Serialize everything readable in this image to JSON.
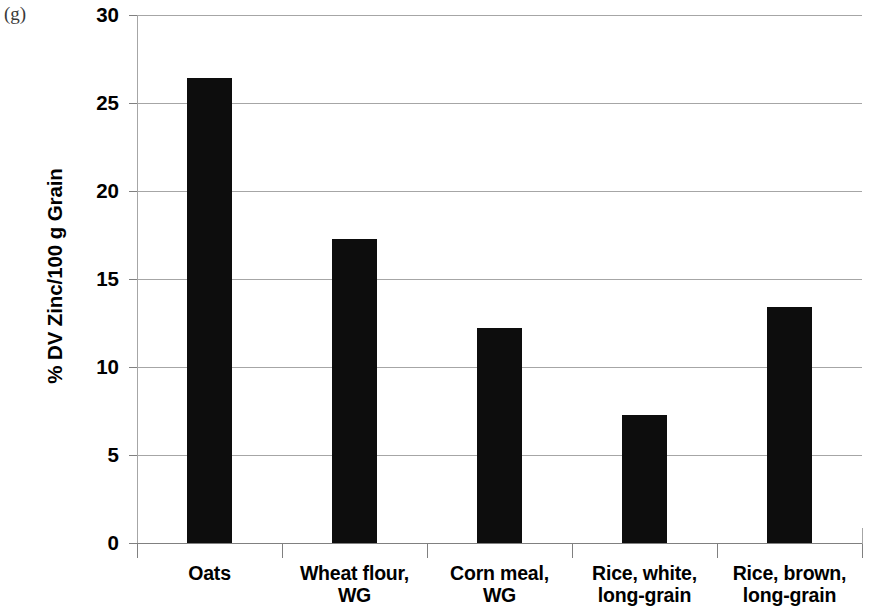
{
  "panel": {
    "letter": "(g)"
  },
  "chart_data": {
    "type": "bar",
    "title": "",
    "xlabel": "",
    "ylabel": "% DV Zinc/100 g Grain",
    "categories": [
      "Oats",
      "Wheat flour, WG",
      "Corn meal, WG",
      "Rice, white, long-grain",
      "Rice, brown, long-grain"
    ],
    "category_lines": [
      [
        "Oats"
      ],
      [
        "Wheat flour,",
        "WG"
      ],
      [
        "Corn meal,",
        "WG"
      ],
      [
        "Rice, white,",
        "long-grain"
      ],
      [
        "Rice, brown,",
        "long-grain"
      ]
    ],
    "values": [
      26.4,
      17.3,
      12.2,
      7.3,
      13.4
    ],
    "ylim": [
      0,
      30
    ],
    "ytick_labels": [
      "30",
      "25",
      "20",
      "15",
      "10",
      "5",
      "0"
    ],
    "ytick_values": [
      30,
      25,
      20,
      15,
      10,
      5,
      0
    ],
    "grid": "horizontal",
    "legend": "none",
    "bar_color": "#0d0d0d",
    "gridline_color": "#a6a6a6",
    "axis_color": "#808080"
  }
}
